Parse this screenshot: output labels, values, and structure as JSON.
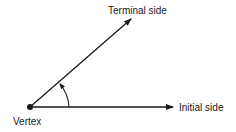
{
  "diagram": {
    "labels": {
      "terminal": "Terminal side",
      "initial": "Initial side",
      "vertex": "Vertex"
    },
    "geometry": {
      "vertex": [
        30,
        107
      ],
      "initial_end": [
        174,
        107
      ],
      "terminal_end": [
        132,
        18
      ]
    },
    "colors": {
      "stroke": "#1a1a1a",
      "background": "#ffffff"
    }
  }
}
